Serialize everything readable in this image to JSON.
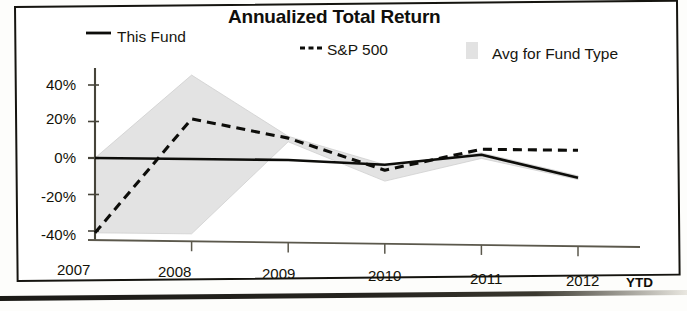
{
  "chart_data": {
    "type": "line",
    "title": "Annualized Total Return",
    "xlabel": "",
    "ylabel": "",
    "categories": [
      "2007",
      "2008",
      "2009",
      "2010",
      "2011",
      "2012"
    ],
    "x_axis_suffix": "YTD",
    "ylim": [
      -48,
      48
    ],
    "ytick_labels": [
      "40%",
      "20%",
      "0%",
      "-20%",
      "-40%"
    ],
    "ytick_values": [
      40,
      20,
      0,
      -20,
      -40
    ],
    "grid": false,
    "legend_position": "top",
    "zero_line": true,
    "series": [
      {
        "name": "This Fund",
        "style": "solid",
        "color": "#0d0d0a",
        "values": [
          0,
          0,
          0,
          -2,
          4,
          -8
        ]
      },
      {
        "name": "S&P 500",
        "style": "dashed",
        "color": "#0d0d0a",
        "values": [
          -41,
          22,
          12,
          -5,
          7,
          7
        ]
      },
      {
        "name": "Avg for Fund Type",
        "style": "band",
        "color": "#e2e2e2",
        "upper": [
          0,
          46,
          13,
          -2,
          5,
          -7
        ],
        "lower": [
          -41,
          -41,
          10,
          -11,
          2,
          -9
        ]
      }
    ]
  },
  "legend": {
    "items": [
      {
        "label": "This Fund",
        "marker": "solid-line-marker"
      },
      {
        "label": "S&P 500",
        "marker": "dashed-line-marker"
      },
      {
        "label": "Avg for Fund Type",
        "marker": "shaded-band-swatch"
      }
    ]
  },
  "colors": {
    "ink": "#0d0d0a",
    "band": "#e2e2e2",
    "axis": "#3a382f",
    "paper": "#ffffff"
  }
}
